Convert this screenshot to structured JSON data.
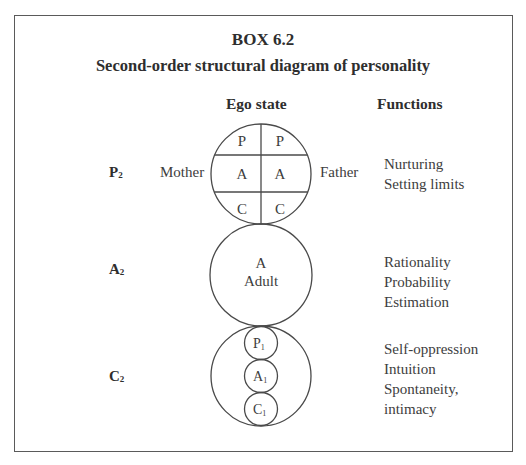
{
  "box": {
    "number": "BOX 6.2",
    "title": "Second-order structural diagram of personality"
  },
  "headers": {
    "ego_state": "Ego state",
    "functions": "Functions"
  },
  "rows": [
    {
      "id": "P2",
      "label_main": "P",
      "label_sub": "2",
      "left_label": "Mother",
      "right_label": "Father",
      "cells": [
        [
          "P",
          "P"
        ],
        [
          "A",
          "A"
        ],
        [
          "C",
          "C"
        ]
      ],
      "functions": [
        "Nurturing",
        "Setting limits"
      ]
    },
    {
      "id": "A2",
      "label_main": "A",
      "label_sub": "2",
      "circle_text": [
        "A",
        "Adult"
      ],
      "functions": [
        "Rationality",
        "Probability",
        "Estimation"
      ]
    },
    {
      "id": "C2",
      "label_main": "C",
      "label_sub": "2",
      "inner_circles": [
        {
          "main": "P",
          "sub": "1"
        },
        {
          "main": "A",
          "sub": "1"
        },
        {
          "main": "C",
          "sub": "1"
        }
      ],
      "functions": [
        "Self-oppression",
        "Intuition",
        "Spontaneity,",
        "intimacy"
      ]
    }
  ],
  "colors": {
    "stroke": "#4a4a4a",
    "text": "#3d3d3d",
    "background": "#ffffff"
  }
}
